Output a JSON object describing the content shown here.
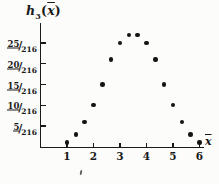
{
  "figure": {
    "background": "#fcfcfa",
    "ink": "#1a1a1a"
  },
  "labels": {
    "func": "h",
    "func_sub": "3",
    "open_paren": "(",
    "var": "x",
    "close_paren": ")",
    "slash": "/"
  },
  "chart_data": {
    "type": "scatter",
    "xlabel": "x-bar",
    "ylabel": "h3(x-bar)",
    "x": [
      1,
      1.3333,
      1.6667,
      2,
      2.3333,
      2.6667,
      3,
      3.3333,
      3.6667,
      4,
      4.3333,
      4.6667,
      5,
      5.3333,
      5.6667,
      6
    ],
    "y_numerators_over_216": [
      1,
      3,
      6,
      10,
      15,
      21,
      25,
      27,
      27,
      25,
      21,
      15,
      10,
      6,
      3,
      1
    ],
    "y_values": [
      0.00463,
      0.01389,
      0.02778,
      0.0463,
      0.06944,
      0.09722,
      0.11574,
      0.125,
      0.125,
      0.11574,
      0.09722,
      0.06944,
      0.0463,
      0.02778,
      0.01389,
      0.00463
    ],
    "x_ticks": [
      "1",
      "2",
      "3",
      "4",
      "5",
      "6"
    ],
    "y_ticks": [
      {
        "num": "5",
        "den": "216"
      },
      {
        "num": "10",
        "den": "216"
      },
      {
        "num": "15",
        "den": "216"
      },
      {
        "num": "20",
        "den": "216"
      },
      {
        "num": "25",
        "den": "216"
      }
    ],
    "xlim": [
      0,
      6.35
    ],
    "ylim_over_216": [
      0,
      29
    ],
    "grid": false,
    "legend": null
  }
}
